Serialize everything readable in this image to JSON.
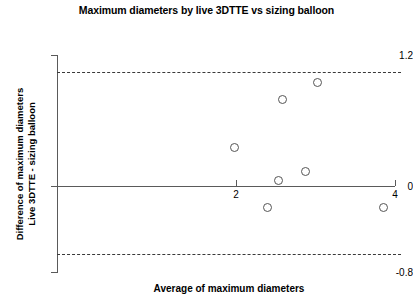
{
  "chart_data": {
    "type": "scatter",
    "title": "Maximum diameters by live 3DTTE vs sizing balloon",
    "xlabel": "Average of maximum diameters",
    "ylabel_line1": "Difference of maximum diameters",
    "ylabel_line2": "Live 3DTTE - sizing balloon",
    "xlim": [
      0.35,
      4.25
    ],
    "ylim": [
      -0.8,
      1.2
    ],
    "grid": false,
    "legend": null,
    "xticks": [
      2,
      4
    ],
    "xtick_labels": [
      "2",
      "4"
    ],
    "yticks": [
      1.2,
      0,
      -0.8
    ],
    "ytick_labels": [
      "1.2",
      "0",
      "-0.8"
    ],
    "x": [
      1.98,
      2.4,
      2.54,
      2.59,
      2.88,
      3.03,
      3.85
    ],
    "y": [
      0.35,
      -0.2,
      0.05,
      0.79,
      0.13,
      0.95,
      -0.2
    ],
    "points": [
      {
        "x": 1.98,
        "y": 0.35
      },
      {
        "x": 2.4,
        "y": -0.2
      },
      {
        "x": 2.54,
        "y": 0.05
      },
      {
        "x": 2.59,
        "y": 0.79
      },
      {
        "x": 2.88,
        "y": 0.13
      },
      {
        "x": 3.03,
        "y": 0.95
      },
      {
        "x": 3.85,
        "y": -0.2
      }
    ],
    "reference_lines": [
      {
        "name": "zero-line",
        "value": 0,
        "style": "solid"
      },
      {
        "name": "upper-limit-of-agreement",
        "value": 1.05,
        "style": "dashed"
      },
      {
        "name": "lower-limit-of-agreement",
        "value": -0.62,
        "style": "dashed"
      }
    ],
    "marker": "open-circle",
    "marker_color": "#555555"
  }
}
